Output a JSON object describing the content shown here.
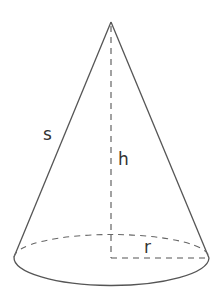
{
  "diagram": {
    "labels": {
      "slant_height": "s",
      "height": "h",
      "radius": "r"
    },
    "colors": {
      "stroke": "#555555",
      "text": "#333333",
      "background": "#ffffff"
    }
  }
}
